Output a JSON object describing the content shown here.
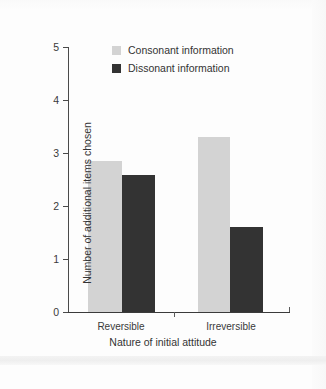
{
  "chart_data": {
    "type": "bar",
    "title": "",
    "xlabel": "Nature of initial attitude",
    "ylabel": "Number of additional items chosen",
    "categories": [
      "Reversible",
      "Irreversible"
    ],
    "series": [
      {
        "name": "Consonant information",
        "color": "#d3d3d3",
        "values": [
          2.85,
          3.3
        ]
      },
      {
        "name": "Dissonant information",
        "color": "#333333",
        "values": [
          2.58,
          1.6
        ]
      }
    ],
    "ylim": [
      0,
      5
    ],
    "yticks": [
      "0",
      "1",
      "2",
      "3",
      "4",
      "5"
    ],
    "grid": false,
    "legend_position": "top-center"
  },
  "legend": {
    "items": [
      {
        "label": "Consonant information",
        "swatch": "light-gray-swatch"
      },
      {
        "label": "Dissonant information",
        "swatch": "dark-swatch"
      }
    ]
  },
  "axes": {
    "y_title": "Number of additional items chosen",
    "x_title": "Nature of initial attitude",
    "y_tick_labels": [
      "5",
      "4",
      "3",
      "2",
      "1",
      "0"
    ],
    "x_tick_labels": [
      "Reversible",
      "Irreversible"
    ]
  }
}
